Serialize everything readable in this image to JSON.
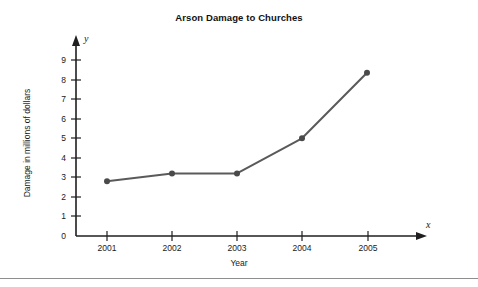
{
  "chart_data": {
    "type": "line",
    "title": "Arson Damage to Churches",
    "xlabel": "Year",
    "ylabel": "Damage in millions of dollars",
    "x_axis_letter": "x",
    "y_axis_letter": "y",
    "categories": [
      "2001",
      "2002",
      "2003",
      "2004",
      "2005"
    ],
    "values": [
      2.8,
      3.2,
      3.2,
      5.0,
      8.35
    ],
    "series": [
      {
        "name": "Arson damage",
        "values": [
          2.8,
          3.2,
          3.2,
          5.0,
          8.35
        ]
      }
    ],
    "xlim": [
      2000.5,
      2005.8
    ],
    "ylim": [
      0,
      9.6
    ],
    "ytick_labels": [
      "0",
      "1",
      "2",
      "3",
      "4",
      "5",
      "6",
      "7",
      "8",
      "9"
    ],
    "ytick_values": [
      0,
      1,
      2,
      3,
      4,
      5,
      6,
      7,
      8,
      9
    ],
    "xtick_labels": [
      "2001",
      "2002",
      "2003",
      "2004",
      "2005"
    ],
    "grid": false,
    "legend": "none",
    "line_color": "#5a5a5a",
    "marker_color": "#4a4a4a",
    "axis_color": "#1f1f1f"
  }
}
